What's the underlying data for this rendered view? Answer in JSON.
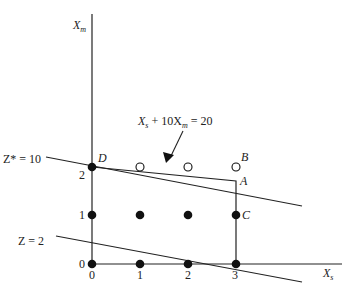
{
  "diagram": {
    "type": "integer-programming-feasible-region",
    "axes": {
      "x_label": "X",
      "x_label_sub": "s",
      "y_label": "X",
      "y_label_sub": "m",
      "x_ticks": [
        "0",
        "1",
        "2",
        "3"
      ],
      "y_ticks": [
        "0",
        "1",
        "2"
      ]
    },
    "constraint_label": {
      "part1": "X",
      "part1_sub": "s",
      "part2": " + 10X",
      "part2_sub": "m",
      "part3": " = 20"
    },
    "objective_lines": [
      {
        "label": "Z* = 10"
      },
      {
        "label": "Z = 2"
      }
    ],
    "points": {
      "D": "D",
      "A": "A",
      "B": "B",
      "C": "C"
    },
    "filled_points": [
      [
        0,
        0
      ],
      [
        1,
        0
      ],
      [
        2,
        0
      ],
      [
        3,
        0
      ],
      [
        0,
        1
      ],
      [
        1,
        1
      ],
      [
        2,
        1
      ],
      [
        3,
        1
      ],
      [
        0,
        2
      ]
    ],
    "open_points": [
      [
        1,
        2
      ],
      [
        2,
        2
      ],
      [
        3,
        2
      ]
    ],
    "colors": {
      "ink": "#111111",
      "background": "#ffffff"
    }
  }
}
